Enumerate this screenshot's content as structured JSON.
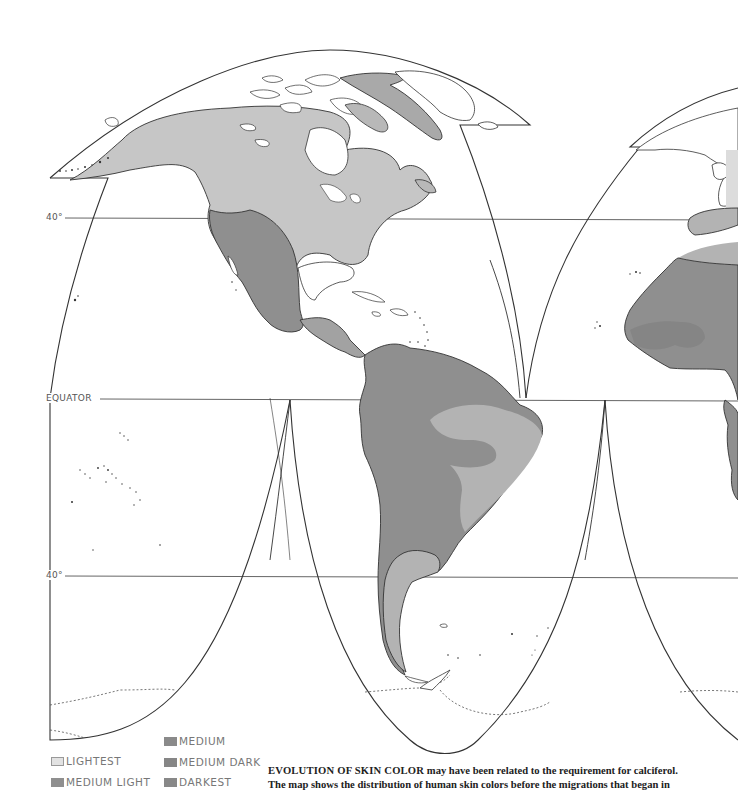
{
  "map": {
    "title": "Distribution of human skin colors",
    "graticule": {
      "north_40_label": "40°",
      "equator_label": "EQUATOR",
      "south_40_label": "40°"
    },
    "regions": [
      {
        "name": "North America",
        "class": "LIGHTEST"
      },
      {
        "name": "Greenland",
        "class": "MEDIUM LIGHT"
      },
      {
        "name": "Western North America / Mexico",
        "class": "MEDIUM DARK"
      },
      {
        "name": "Central America",
        "class": "MEDIUM"
      },
      {
        "name": "Northern South America",
        "class": "MEDIUM DARK"
      },
      {
        "name": "Eastern Brazil",
        "class": "MEDIUM LIGHT"
      },
      {
        "name": "Patagonia",
        "class": "MEDIUM LIGHT"
      },
      {
        "name": "Iberia",
        "class": "MEDIUM LIGHT"
      },
      {
        "name": "North Africa coast",
        "class": "MEDIUM LIGHT"
      },
      {
        "name": "West Africa",
        "class": "MEDIUM DARK"
      },
      {
        "name": "West Africa interior",
        "class": "DARKEST"
      }
    ]
  },
  "legend": {
    "items": [
      {
        "label": "LIGHTEST",
        "color": "#dcdcdc"
      },
      {
        "label": "MEDIUM LIGHT",
        "color": "#a8a8a8"
      },
      {
        "label": "MEDIUM",
        "color": "#989898"
      },
      {
        "label": "MEDIUM DARK",
        "color": "#8c8c8c"
      },
      {
        "label": "DARKEST",
        "color": "#858585"
      }
    ]
  },
  "colors": {
    "lightest": "#c8c8c8",
    "medium_light": "#b2b2b2",
    "medium": "#a2a2a2",
    "medium_dark": "#8f8f8f",
    "darkest": "#848484",
    "outline": "#333333",
    "graticule": "#666666"
  },
  "caption": {
    "lead": "EVOLUTION OF SKIN COLOR",
    "line1_rest": " may have been related to the requirement for calciferol.",
    "line2": "The map shows the distribution of human skin colors before the migrations that began in"
  }
}
